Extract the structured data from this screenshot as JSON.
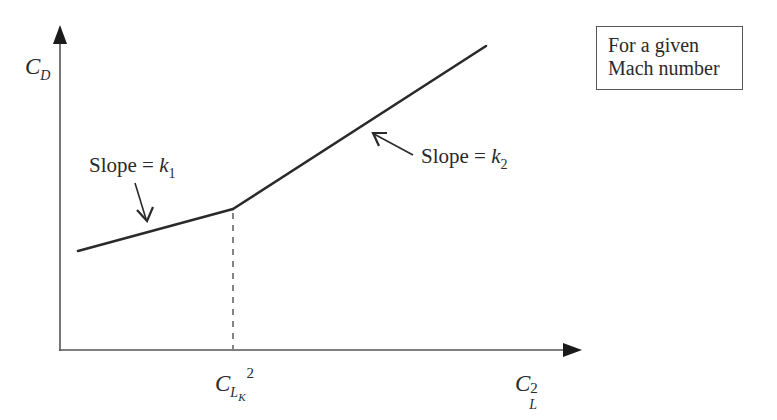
{
  "diagram": {
    "type": "piecewise-linear drag polar sketch",
    "y_axis": {
      "symbol": "C",
      "subscript": "D"
    },
    "x_axis": {
      "symbol": "C",
      "subscript": "L",
      "superscript": "2"
    },
    "breakpoint_label": {
      "symbol": "C",
      "subscript": "L",
      "subsubscript": "K",
      "superscript": "2"
    },
    "annotations": [
      {
        "id": "slope-1",
        "text": "Slope = ",
        "var": "k",
        "subscript": "1"
      },
      {
        "id": "slope-2",
        "text": "Slope = ",
        "var": "k",
        "subscript": "2"
      }
    ],
    "note_box": {
      "lines": [
        "For a given",
        "Mach number"
      ]
    },
    "segments": [
      {
        "name": "low-lift segment",
        "slope": "k1"
      },
      {
        "name": "high-lift segment",
        "slope": "k2"
      }
    ],
    "colors": {
      "ink": "#2a2a2a",
      "axis": "#555555",
      "background": "#ffffff"
    }
  }
}
